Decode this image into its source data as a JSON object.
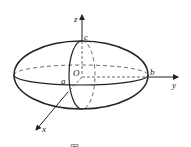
{
  "figure": {
    "type": "ellipsoid-with-axes",
    "labels": {
      "z_axis": "z",
      "y_axis": "y",
      "x_axis": "x",
      "origin": "O",
      "a": "a",
      "b": "b",
      "c": "c"
    },
    "caption": "图",
    "colors": {
      "stroke": "#222222",
      "background": "#ffffff"
    }
  }
}
